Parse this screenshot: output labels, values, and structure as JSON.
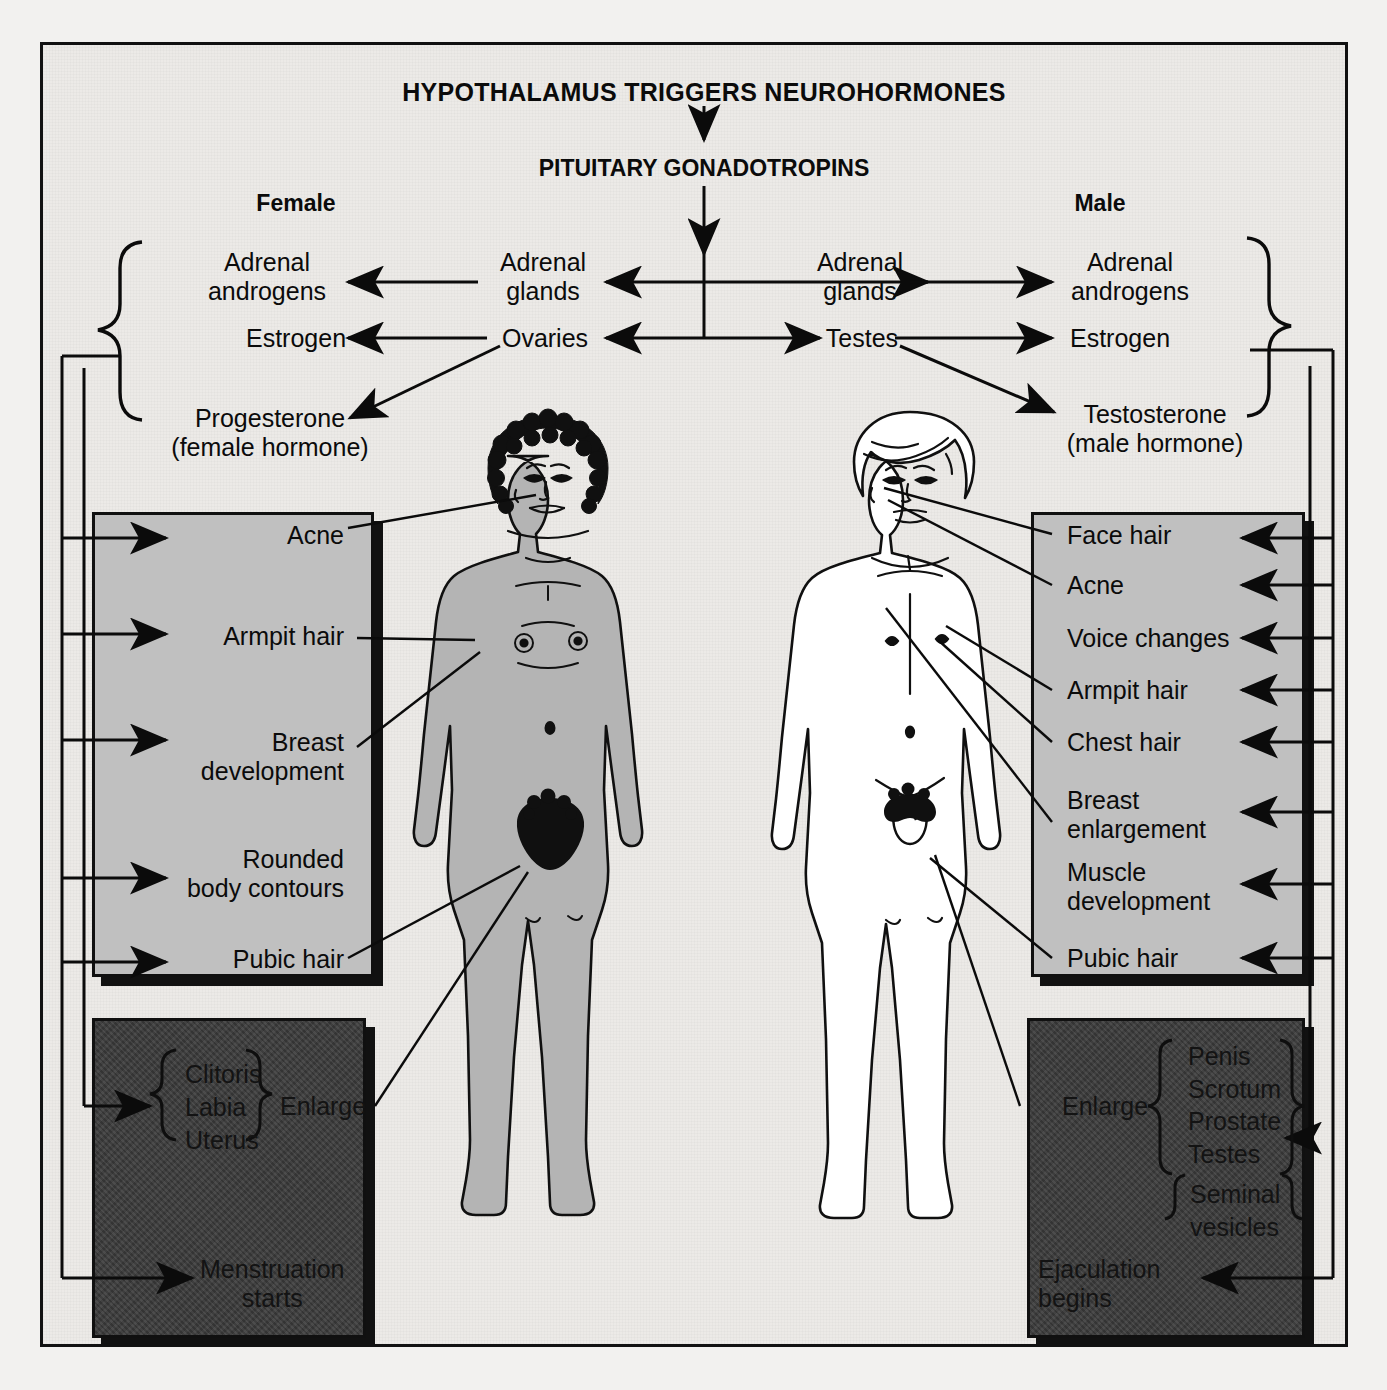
{
  "diagram": {
    "title": "HYPOTHALAMUS TRIGGERS NEUROHORMONES",
    "subtitle": "PITUITARY GONADOTROPINS",
    "female_heading": "Female",
    "male_heading": "Male"
  },
  "female_pathway": {
    "source_adrenal": "Adrenal\nglands",
    "source_gonad": "Ovaries",
    "product_androgens": "Adrenal\nandrogens",
    "product_estrogen": "Estrogen",
    "product_progesterone": "Progesterone\n(female hormone)"
  },
  "male_pathway": {
    "source_adrenal": "Adrenal\nglands",
    "source_gonad": "Testes",
    "product_androgens": "Adrenal\nandrogens",
    "product_estrogen": "Estrogen",
    "product_testosterone": "Testosterone\n(male hormone)"
  },
  "female_traits": [
    "Acne",
    "Armpit hair",
    "Breast\ndevelopment",
    "Rounded\nbody contours",
    "Pubic hair"
  ],
  "male_traits": [
    "Face hair",
    "Acne",
    "Voice changes",
    "Armpit hair",
    "Chest hair",
    "Breast\nenlargement",
    "Muscle\ndevelopment",
    "Pubic hair"
  ],
  "female_organs": {
    "list": "Clitoris\nLabia\nUterus",
    "action": "Enlarge",
    "event": "Menstruation\nstarts"
  },
  "male_organs": {
    "action": "Enlarge",
    "list_primary": "Penis\nScrotum\nProstate\nTestes",
    "list_secondary": "Seminal\nvesicles",
    "event": "Ejaculation\nbegins"
  },
  "colors": {
    "paper": "#eceae7",
    "grey_box": "#c0c0c0",
    "dark_box": "#3b3b3b",
    "ink": "#0b0b0b",
    "female_skin": "#b4b4b4"
  },
  "figures": {
    "female_label": "female-adolescent-figure",
    "male_label": "male-adolescent-figure"
  }
}
